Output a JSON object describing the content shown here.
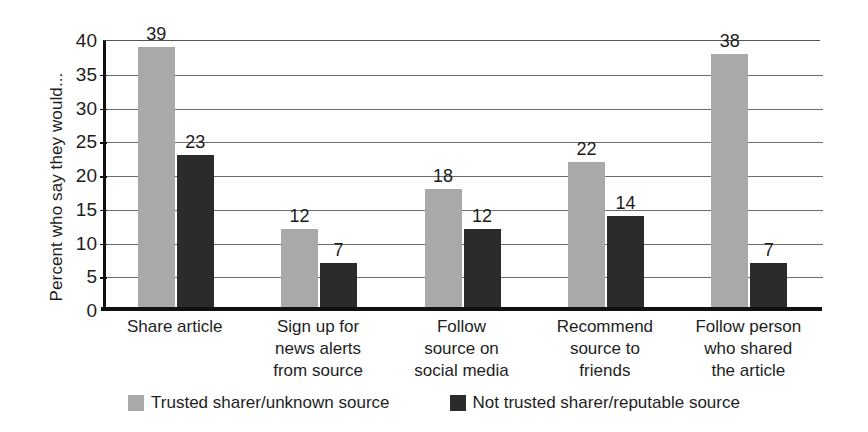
{
  "chart_data": {
    "type": "bar",
    "title": "",
    "subtitle": "",
    "xlabel": "",
    "ylabel": "Percent who say they would...",
    "ylim": [
      0,
      40
    ],
    "yticks": [
      0,
      5,
      10,
      15,
      20,
      25,
      30,
      35,
      40
    ],
    "ytick_labels": [
      "0",
      "5",
      "10",
      "15",
      "20",
      "25",
      "30",
      "35",
      "40"
    ],
    "grid": true,
    "legend_position": "bottom",
    "categories": [
      "Share article",
      "Sign up for\nnews alerts\nfrom source",
      "Follow\nsource on\nsocial media",
      "Recommend\nsource to\nfriends",
      "Follow person\nwho shared\nthe article"
    ],
    "category_lines": [
      [
        "Share article"
      ],
      [
        "Sign up for",
        "news alerts",
        "from source"
      ],
      [
        "Follow",
        "source on",
        "social media"
      ],
      [
        "Recommend",
        "source to",
        "friends"
      ],
      [
        "Follow person",
        "who shared",
        "the article"
      ]
    ],
    "series": [
      {
        "name": "Trusted sharer/unknown source",
        "color": "#a9a9a9",
        "values": [
          39,
          12,
          18,
          22,
          38
        ],
        "value_labels": [
          "39",
          "12",
          "18",
          "22",
          "38"
        ]
      },
      {
        "name": "Not trusted sharer/reputable source",
        "color": "#2b2b2b",
        "values": [
          23,
          7,
          12,
          14,
          7
        ],
        "value_labels": [
          "23",
          "7",
          "12",
          "14",
          "7"
        ]
      }
    ]
  },
  "legend": {
    "items": [
      {
        "label": "Trusted sharer/unknown source",
        "color": "#a9a9a9"
      },
      {
        "label": "Not trusted sharer/reputable source",
        "color": "#2b2b2b"
      }
    ]
  },
  "colors": {
    "series_light": "#a9a9a9",
    "series_dark": "#2b2b2b",
    "axis": "#111111",
    "gridline": "#6d6d6d",
    "text": "#1e1e1e",
    "background": "#ffffff"
  }
}
